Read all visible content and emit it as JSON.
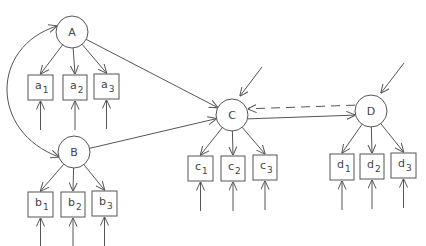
{
  "diagram": {
    "type": "structural-equation-model",
    "colors": {
      "stroke": "#555555",
      "text": "#444444",
      "background": "#ffffff"
    },
    "latent_nodes": [
      {
        "id": "A",
        "label": "A",
        "cx": 72,
        "cy": 32,
        "r": 16
      },
      {
        "id": "B",
        "label": "B",
        "cx": 74,
        "cy": 152,
        "r": 16
      },
      {
        "id": "C",
        "label": "C",
        "cx": 232,
        "cy": 115,
        "r": 16
      },
      {
        "id": "D",
        "label": "D",
        "cx": 371,
        "cy": 111,
        "r": 16
      }
    ],
    "indicators": [
      {
        "id": "a1",
        "base": "a",
        "sub": "1",
        "x": 28,
        "y": 75,
        "w": 25,
        "h": 25,
        "parent": "A"
      },
      {
        "id": "a2",
        "base": "a",
        "sub": "2",
        "x": 63,
        "y": 75,
        "w": 24,
        "h": 25,
        "parent": "A"
      },
      {
        "id": "a3",
        "base": "a",
        "sub": "3",
        "x": 94,
        "y": 74,
        "w": 25,
        "h": 25,
        "parent": "A"
      },
      {
        "id": "b1",
        "base": "b",
        "sub": "1",
        "x": 28,
        "y": 192,
        "w": 25,
        "h": 25,
        "parent": "B"
      },
      {
        "id": "b2",
        "base": "b",
        "sub": "2",
        "x": 61,
        "y": 192,
        "w": 24,
        "h": 25,
        "parent": "B"
      },
      {
        "id": "b3",
        "base": "b",
        "sub": "3",
        "x": 92,
        "y": 191,
        "w": 25,
        "h": 25,
        "parent": "B"
      },
      {
        "id": "c1",
        "base": "c",
        "sub": "1",
        "x": 188,
        "y": 156,
        "w": 25,
        "h": 25,
        "parent": "C"
      },
      {
        "id": "c2",
        "base": "c",
        "sub": "2",
        "x": 221,
        "y": 156,
        "w": 24,
        "h": 25,
        "parent": "C"
      },
      {
        "id": "c3",
        "base": "c",
        "sub": "3",
        "x": 253,
        "y": 155,
        "w": 24,
        "h": 25,
        "parent": "C"
      },
      {
        "id": "d1",
        "base": "d",
        "sub": "1",
        "x": 330,
        "y": 154,
        "w": 24,
        "h": 26,
        "parent": "D"
      },
      {
        "id": "d2",
        "base": "d",
        "sub": "2",
        "x": 360,
        "y": 154,
        "w": 24,
        "h": 25,
        "parent": "D"
      },
      {
        "id": "d3",
        "base": "d",
        "sub": "3",
        "x": 391,
        "y": 153,
        "w": 25,
        "h": 25,
        "parent": "D"
      }
    ],
    "structural_paths": [
      {
        "from": "A",
        "to": "C",
        "style": "solid"
      },
      {
        "from": "B",
        "to": "C",
        "style": "solid"
      },
      {
        "from": "C",
        "to": "D",
        "style": "solid"
      },
      {
        "from": "D",
        "to": "C",
        "style": "dashed"
      }
    ],
    "covariances": [
      {
        "between": [
          "A",
          "B"
        ],
        "style": "curved-double-headed"
      }
    ],
    "disturbances": [
      {
        "target": "C",
        "x1": 262,
        "y1": 67,
        "x2": 240,
        "y2": 96
      },
      {
        "target": "D",
        "x1": 404,
        "y1": 63,
        "x2": 381,
        "y2": 93
      }
    ],
    "error_terms_count": 12
  }
}
